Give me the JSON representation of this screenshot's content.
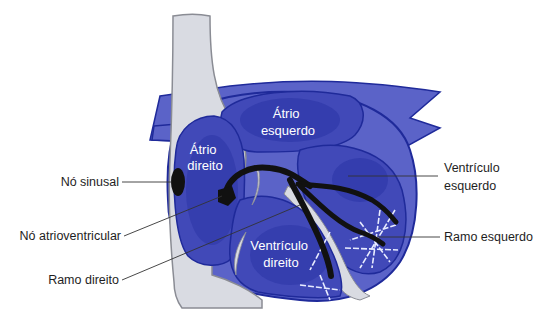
{
  "diagram": {
    "colors": {
      "heart_outer": "#5b63c8",
      "heart_dark": "#2c35a6",
      "heart_mid": "#4149b8",
      "outline": "#1f2a9a",
      "vessel": "#d9dbe2",
      "vessel_outline": "#8a8c94",
      "conduction": "#111111",
      "purkinje": "#e8ecff"
    },
    "inner_labels": {
      "atrio_esquerdo": [
        "Átrio",
        "esquerdo"
      ],
      "atrio_direito": [
        "Átrio",
        "direito"
      ],
      "ventriculo_direito": [
        "Ventrículo",
        "direito"
      ]
    },
    "callouts": {
      "no_sinusal": "Nó sinusal",
      "no_atrioventricular": "Nó atrioventricular",
      "ramo_direito": "Ramo direito",
      "ventriculo_esquerdo": [
        "Ventrículo",
        "esquerdo"
      ],
      "ramo_esquerdo": "Ramo esquerdo"
    }
  }
}
